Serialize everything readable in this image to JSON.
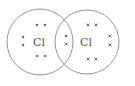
{
  "diagram": {
    "type": "dot-and-cross",
    "molecule": "Cl2",
    "atoms": [
      {
        "symbol": "Cl",
        "electron_marker": "dot",
        "cx": 40,
        "cy": 42,
        "r": 33
      },
      {
        "symbol": "Cl",
        "electron_marker": "cross",
        "cx": 87,
        "cy": 42,
        "r": 32
      }
    ],
    "shared_pair": [
      "dot",
      "cross"
    ],
    "colors": {
      "line": "#8a8a8a",
      "text": "#555555",
      "marker": "#707070"
    }
  }
}
